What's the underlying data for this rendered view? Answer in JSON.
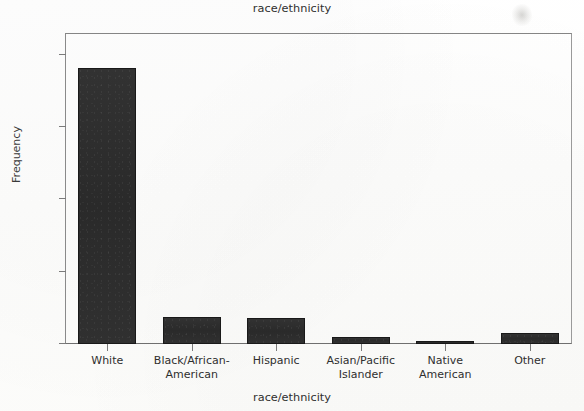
{
  "chart_data": {
    "type": "bar",
    "title": "race/ethnicity",
    "xlabel": "race/ethnicity",
    "ylabel": "Frequency",
    "categories": [
      "White",
      "Black/African-\nAmerican",
      "Hispanic",
      "Asian/Pacific\nIslander",
      "Native\nAmerican",
      "Other"
    ],
    "values": [
      762,
      75,
      72,
      19,
      5,
      31
    ],
    "ylim": [
      0,
      860
    ],
    "yticks": [
      0,
      200,
      400,
      600,
      800
    ],
    "ytick_labels": [
      "0",
      "200",
      "400",
      "600",
      "800"
    ],
    "grid": false,
    "legend": false,
    "bar_color": "#2c2c2c",
    "frame_color": "#8d8d8d",
    "background_color": "#fdfdfc"
  },
  "figure": {
    "title_top": "race/ethnicity",
    "title_bottom": "race/ethnicity",
    "y_axis_label": "Frequency"
  }
}
